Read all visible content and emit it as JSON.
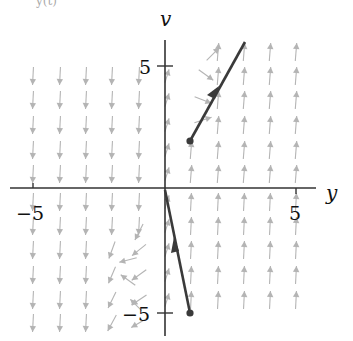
{
  "figure": {
    "top_fragment": "y(t)",
    "axes": {
      "x_label": "y",
      "y_label": "v",
      "x_ticks": [
        {
          "value": -5,
          "label": "−5"
        },
        {
          "value": 5,
          "label": "5"
        }
      ],
      "y_ticks": [
        {
          "value": 5,
          "label": "5"
        },
        {
          "value": -5,
          "label": "−5"
        }
      ],
      "x_range": [
        -5.5,
        5.5
      ],
      "y_range": [
        -5.5,
        5.8
      ]
    },
    "colors": {
      "axis": "#333333",
      "field_arrows": "#b4b4b4",
      "trajectory": "#3a3a3a"
    },
    "trajectories": [
      {
        "name": "upper",
        "start": [
          1,
          2
        ],
        "end": [
          3.1,
          6
        ],
        "direction": "increasing"
      },
      {
        "name": "lower",
        "start": [
          1,
          -5
        ],
        "end": [
          0,
          0
        ],
        "direction": "toward-origin"
      }
    ]
  }
}
